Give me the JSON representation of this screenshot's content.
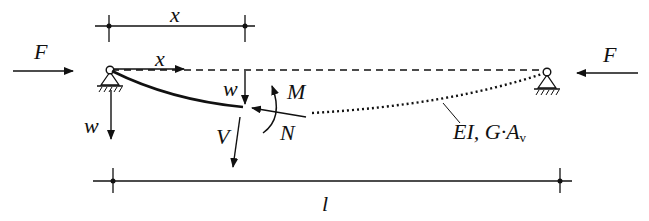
{
  "figure": {
    "type": "beam-column free-body diagram",
    "colors": {
      "ink": "#111111",
      "background": "#ffffff"
    }
  },
  "labels": {
    "top_dimension": "x",
    "axis_x": "x",
    "force_left": "F",
    "force_right": "F",
    "deflection_local": "w",
    "deflection_axis": "w",
    "moment": "M",
    "normal_force": "N",
    "shear_force": "V",
    "stiffness_main": "EI, G·A",
    "stiffness_sub": "v",
    "span_length": "l"
  }
}
